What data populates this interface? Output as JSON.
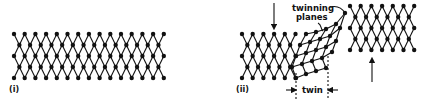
{
  "figure": {
    "panels": [
      {
        "id": "i",
        "label": "(i)",
        "description": "perfect crystal lattice"
      },
      {
        "id": "ii",
        "label": "(ii)",
        "description": "twinned lattice under shear"
      }
    ],
    "annotations": {
      "twinning_planes": [
        "twinning",
        "planes"
      ],
      "twin": "twin"
    },
    "colors": {
      "ink": "#111111",
      "background": "#ffffff"
    }
  }
}
